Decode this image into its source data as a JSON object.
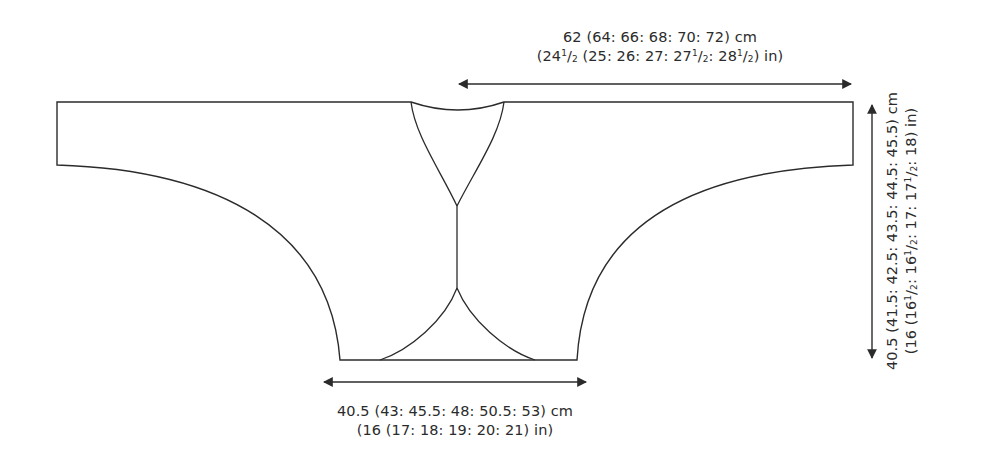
{
  "diagram": {
    "type": "knitting-schematic",
    "stroke_color": "#2b2b2b",
    "background_color": "#ffffff"
  },
  "measurements": {
    "half_width": {
      "cm": "62 (64: 66: 68: 70: 72) cm",
      "in_parts": [
        "(24",
        "1",
        "/",
        "2",
        " (25: 26: 27: 27",
        "1",
        "/",
        "2",
        ": 28",
        "1",
        "/",
        "2",
        ") in)"
      ]
    },
    "hem_width": {
      "cm": "40.5 (43: 45.5: 48: 50.5: 53) cm",
      "in": "(16 (17: 18: 19: 20: 21) in)"
    },
    "length": {
      "cm": "40.5 (41.5: 42.5: 43.5: 44.5: 45.5) cm",
      "in_parts": [
        "(16 (16",
        "1",
        "/",
        "2",
        ": 16",
        "1",
        "/",
        "2",
        ": 17: 17",
        "1",
        "/",
        "2",
        ": 18) in)"
      ]
    }
  }
}
